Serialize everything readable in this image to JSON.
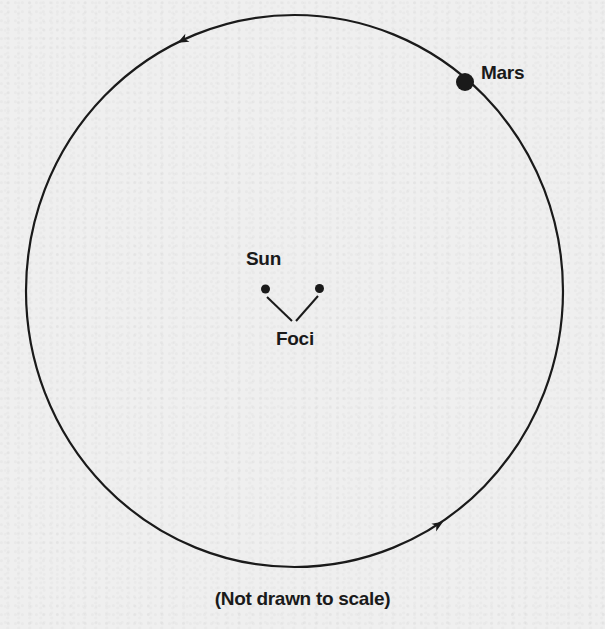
{
  "figure": {
    "labels": {
      "planet": "Mars",
      "star": "Sun",
      "foci": "Foci"
    },
    "caption": "(Not drawn to scale)",
    "colors": {
      "ink": "#1a1a1a",
      "paper": "#efefef"
    },
    "orbit": {
      "shape": "ellipse",
      "center_x": 294.5,
      "center_y": 291,
      "radius_x": 268.5,
      "radius_y": 276,
      "direction": "counterclockwise",
      "arrows": [
        {
          "x": 183,
          "y": 40,
          "points": "down-left"
        },
        {
          "x": 438,
          "y": 525,
          "points": "up-right"
        }
      ]
    },
    "planet_marker": {
      "x": 465,
      "y": 82,
      "r": 9
    },
    "focus_points": [
      {
        "name": "left-focus (Sun)",
        "x": 265.5,
        "y": 289,
        "r": 4.5
      },
      {
        "name": "right-focus",
        "x": 319.5,
        "y": 288.5,
        "r": 4.5
      }
    ],
    "focus_pointer_lines": [
      {
        "x1": 267,
        "y1": 297,
        "x2": 292,
        "y2": 321
      },
      {
        "x1": 318,
        "y1": 296,
        "x2": 296,
        "y2": 321
      }
    ]
  }
}
